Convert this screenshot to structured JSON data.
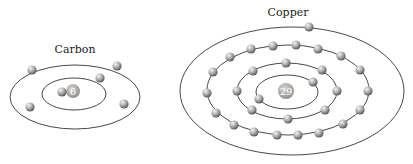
{
  "atoms": [
    {
      "name": "Carbon",
      "atomic_number": "6",
      "label_pos": [
        75,
        53
      ],
      "nucleus": [
        73,
        91,
        7
      ],
      "orbits": [
        {
          "cx": 74,
          "cy": 94,
          "rx": 32,
          "ry": 16
        },
        {
          "cx": 75,
          "cy": 97,
          "rx": 65,
          "ry": 32
        }
      ],
      "electrons": [
        [
          62,
          92
        ],
        [
          100,
          78
        ],
        [
          32,
          70
        ],
        [
          117,
          66
        ],
        [
          30,
          107
        ],
        [
          124,
          104
        ]
      ]
    },
    {
      "name": "Copper",
      "atomic_number": "29",
      "label_pos": [
        288,
        16
      ],
      "nucleus": [
        286,
        91,
        8
      ],
      "orbits": [
        {
          "cx": 287,
          "cy": 92,
          "rx": 31,
          "ry": 17
        },
        {
          "cx": 287,
          "cy": 91,
          "rx": 50,
          "ry": 28
        },
        {
          "cx": 288,
          "cy": 90,
          "rx": 81,
          "ry": 45
        },
        {
          "cx": 292,
          "cy": 91,
          "rx": 112,
          "ry": 64
        }
      ],
      "electrons": [
        [
          313,
          82
        ],
        [
          259,
          99
        ],
        [
          286,
          63
        ],
        [
          253,
          71
        ],
        [
          237,
          91
        ],
        [
          252,
          110
        ],
        [
          288,
          119
        ],
        [
          325,
          110
        ],
        [
          337,
          91
        ],
        [
          322,
          70
        ],
        [
          230,
          57
        ],
        [
          251,
          49
        ],
        [
          273,
          46
        ],
        [
          296,
          45
        ],
        [
          318,
          49
        ],
        [
          341,
          56
        ],
        [
          360,
          70
        ],
        [
          368,
          91
        ],
        [
          360,
          110
        ],
        [
          343,
          124
        ],
        [
          319,
          133
        ],
        [
          298,
          135
        ],
        [
          277,
          135
        ],
        [
          254,
          132
        ],
        [
          234,
          125
        ],
        [
          216,
          113
        ],
        [
          207,
          93
        ],
        [
          213,
          72
        ],
        [
          309,
          27
        ]
      ]
    }
  ]
}
